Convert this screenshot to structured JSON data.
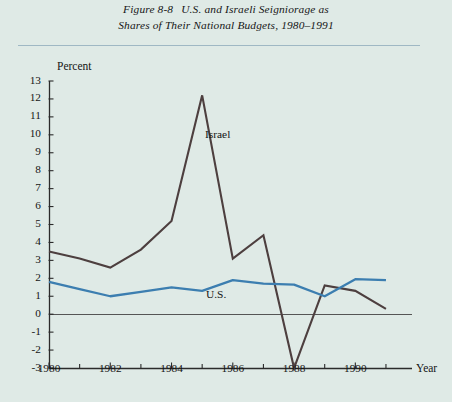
{
  "figure": {
    "number": "Figure 8-8",
    "title_line1": "U.S. and Israeli Seigniorage as",
    "title_line2": "Shares of Their National Budgets, 1980–1991"
  },
  "axes": {
    "y_unit_label": "Percent",
    "x_unit_label": "Year",
    "y_ticks": [
      "13",
      "12",
      "11",
      "10",
      "9",
      "8",
      "7",
      "6",
      "5",
      "4",
      "3",
      "2",
      "1",
      "0",
      "-1",
      "-2",
      "-3"
    ],
    "x_ticks": [
      "1980",
      "1982",
      "1984",
      "1986",
      "1988",
      "1990"
    ]
  },
  "series_labels": {
    "israel": "Israel",
    "us": "U.S."
  },
  "colors": {
    "background": "#dfeae6",
    "israel_line": "#4d3f3f",
    "us_line": "#3c7eb0",
    "axis": "#2b2b2b",
    "zero_line": "#555555",
    "header_rule": "#9fb8c4"
  },
  "chart_data": {
    "type": "line",
    "xlabel": "Year",
    "ylabel": "Percent",
    "xlim": [
      1980,
      1991
    ],
    "ylim": [
      -3,
      13
    ],
    "ytick_interval": 1,
    "xtick_interval": 2,
    "x_minor_ticks": [
      1981,
      1983,
      1985,
      1987,
      1989,
      1991
    ],
    "grid": false,
    "legend": "inline-labels",
    "zero_reference_line": 0,
    "x": [
      1980,
      1981,
      1982,
      1983,
      1984,
      1985,
      1986,
      1987,
      1988,
      1989,
      1990,
      1991
    ],
    "series": [
      {
        "name": "Israel",
        "color": "#4d3f3f",
        "values": [
          3.5,
          3.1,
          2.6,
          3.6,
          5.2,
          12.2,
          3.1,
          4.4,
          -3.0,
          1.6,
          1.3,
          0.3
        ]
      },
      {
        "name": "U.S.",
        "color": "#3c7eb0",
        "values": [
          1.8,
          1.4,
          1.0,
          1.25,
          1.5,
          1.3,
          1.9,
          1.7,
          1.65,
          1.0,
          1.95,
          1.9
        ]
      }
    ],
    "annotations": [
      {
        "text": "Israel",
        "x": 1986.0,
        "y": 9.6
      },
      {
        "text": "U.S.",
        "x": 1986.0,
        "y": 0.95
      }
    ]
  },
  "geometry": {
    "plot_left": 49,
    "plot_right": 412,
    "y_top_px": 81,
    "y_bottom_px": 368,
    "y_top_value": 13,
    "y_bottom_value": -3,
    "x_left_year": 1980,
    "x_right_year": 1991.85
  }
}
